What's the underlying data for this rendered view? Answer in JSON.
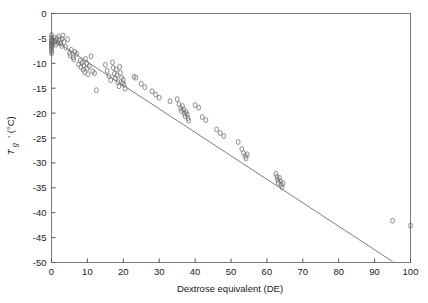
{
  "chart_data": {
    "type": "scatter",
    "title": "",
    "xlabel": "Dextrose equivalent (DE)",
    "ylabel_main": "T",
    "ylabel_sub": "g",
    "ylabel_prime": "' (°C)",
    "ylabel_full": "T g' (°C)",
    "xlim": [
      0,
      100
    ],
    "ylim": [
      -50,
      0
    ],
    "xticks": [
      0,
      10,
      20,
      30,
      40,
      50,
      60,
      70,
      80,
      90,
      100
    ],
    "xtick_labels": [
      "0",
      "10",
      "20",
      "30",
      "40",
      "50",
      "60",
      "70",
      "80",
      "90",
      "100"
    ],
    "yticks": [
      0,
      -5,
      -10,
      -15,
      -20,
      -25,
      -30,
      -35,
      -40,
      -45,
      -50
    ],
    "ytick_labels": [
      "0",
      "-5",
      "-10",
      "-15",
      "-20",
      "-25",
      "-30",
      "-35",
      "-40",
      "-45",
      "-50"
    ],
    "grid": false,
    "legend": false,
    "marker": "open-circle",
    "marker_color": "#6a6a6a",
    "line_color": "#6e6e6e",
    "frame_color": "#7a7a7a",
    "series": [
      {
        "name": "T_g' vs DE",
        "marker": "open-circle",
        "points": [
          [
            0.0,
            -4.3
          ],
          [
            0.0,
            -4.8
          ],
          [
            0.0,
            -5.2
          ],
          [
            0.0,
            -5.5
          ],
          [
            0.0,
            -5.8
          ],
          [
            0.0,
            -6.0
          ],
          [
            0.0,
            -6.2
          ],
          [
            0.0,
            -6.4
          ],
          [
            0.0,
            -6.6
          ],
          [
            0.0,
            -6.9
          ],
          [
            0.0,
            -7.2
          ],
          [
            0.0,
            -7.6
          ],
          [
            0.0,
            -8.0
          ],
          [
            0.5,
            -5.4
          ],
          [
            0.5,
            -6.1
          ],
          [
            0.8,
            -4.9
          ],
          [
            1.0,
            -5.6
          ],
          [
            1.2,
            -6.3
          ],
          [
            1.5,
            -5.0
          ],
          [
            1.8,
            -5.9
          ],
          [
            2.0,
            -4.6
          ],
          [
            2.2,
            -5.3
          ],
          [
            2.5,
            -6.0
          ],
          [
            2.8,
            -6.5
          ],
          [
            3.0,
            -5.1
          ],
          [
            3.2,
            -4.4
          ],
          [
            3.5,
            -5.7
          ],
          [
            4.0,
            -6.8
          ],
          [
            4.5,
            -5.2
          ],
          [
            5.0,
            -7.9
          ],
          [
            5.2,
            -8.4
          ],
          [
            5.5,
            -7.3
          ],
          [
            6.0,
            -8.8
          ],
          [
            6.2,
            -9.2
          ],
          [
            6.5,
            -7.7
          ],
          [
            7.0,
            -8.1
          ],
          [
            7.5,
            -10.2
          ],
          [
            8.0,
            -9.5
          ],
          [
            8.2,
            -10.8
          ],
          [
            8.5,
            -9.9
          ],
          [
            8.8,
            -11.3
          ],
          [
            9.0,
            -10.4
          ],
          [
            9.2,
            -11.8
          ],
          [
            9.5,
            -9.1
          ],
          [
            9.8,
            -10.0
          ],
          [
            10.0,
            -11.0
          ],
          [
            10.2,
            -12.2
          ],
          [
            10.5,
            -10.6
          ],
          [
            11.0,
            -8.6
          ],
          [
            11.5,
            -11.6
          ],
          [
            12.0,
            -12.0
          ],
          [
            12.5,
            -15.4
          ],
          [
            15.0,
            -10.3
          ],
          [
            15.5,
            -11.5
          ],
          [
            16.0,
            -12.6
          ],
          [
            16.5,
            -13.4
          ],
          [
            17.0,
            -9.8
          ],
          [
            17.2,
            -10.9
          ],
          [
            17.5,
            -12.1
          ],
          [
            17.8,
            -13.0
          ],
          [
            18.0,
            -11.2
          ],
          [
            18.2,
            -12.4
          ],
          [
            18.5,
            -13.8
          ],
          [
            18.8,
            -14.6
          ],
          [
            19.0,
            -10.7
          ],
          [
            19.2,
            -11.9
          ],
          [
            19.5,
            -12.9
          ],
          [
            19.8,
            -14.0
          ],
          [
            20.0,
            -13.3
          ],
          [
            20.2,
            -14.3
          ],
          [
            20.5,
            -15.1
          ],
          [
            23.0,
            -12.7
          ],
          [
            23.5,
            -12.9
          ],
          [
            25.0,
            -14.1
          ],
          [
            26.0,
            -14.8
          ],
          [
            28.0,
            -15.6
          ],
          [
            29.0,
            -16.3
          ],
          [
            30.0,
            -16.9
          ],
          [
            33.0,
            -17.6
          ],
          [
            35.0,
            -17.2
          ],
          [
            35.5,
            -18.2
          ],
          [
            36.0,
            -19.0
          ],
          [
            36.2,
            -19.6
          ],
          [
            36.5,
            -18.6
          ],
          [
            36.8,
            -19.3
          ],
          [
            37.0,
            -20.0
          ],
          [
            37.2,
            -20.6
          ],
          [
            37.5,
            -19.8
          ],
          [
            37.8,
            -20.3
          ],
          [
            38.0,
            -21.0
          ],
          [
            38.2,
            -21.5
          ],
          [
            40.0,
            -18.4
          ],
          [
            41.0,
            -18.9
          ],
          [
            42.0,
            -20.8
          ],
          [
            43.0,
            -21.4
          ],
          [
            46.0,
            -23.3
          ],
          [
            47.0,
            -24.0
          ],
          [
            48.0,
            -24.6
          ],
          [
            52.0,
            -25.8
          ],
          [
            53.0,
            -27.2
          ],
          [
            53.5,
            -28.0
          ],
          [
            54.0,
            -28.6
          ],
          [
            54.2,
            -29.1
          ],
          [
            54.5,
            -28.3
          ],
          [
            62.5,
            -32.2
          ],
          [
            62.8,
            -32.8
          ],
          [
            63.0,
            -33.4
          ],
          [
            63.2,
            -34.0
          ],
          [
            63.5,
            -33.0
          ],
          [
            63.8,
            -33.7
          ],
          [
            64.0,
            -34.4
          ],
          [
            64.2,
            -34.9
          ],
          [
            64.5,
            -34.1
          ],
          [
            95.0,
            -41.6
          ],
          [
            100.0,
            -42.6
          ]
        ]
      }
    ],
    "fit_line": {
      "name": "linear regression",
      "x_start": 0.0,
      "y_start": -5.0,
      "x_end": 95.0,
      "y_end": -49.8,
      "slope": -0.4716,
      "intercept": -5.0
    }
  }
}
